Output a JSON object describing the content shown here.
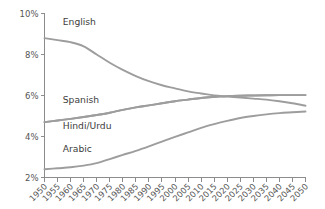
{
  "chart_data": {
    "type": "line",
    "title": "",
    "subtitle": "",
    "xlabel": "",
    "ylabel": "",
    "xlim": [
      1950,
      2050
    ],
    "ylim": [
      2,
      10
    ],
    "yticks": [
      10,
      8,
      6,
      4,
      2
    ],
    "ytick_labels": [
      "10%",
      "8%",
      "6%",
      "4%",
      "2%"
    ],
    "grid": false,
    "legend_position": "inline-labels",
    "x": [
      1950,
      1955,
      1960,
      1965,
      1970,
      1975,
      1980,
      1985,
      1990,
      1995,
      2000,
      2005,
      2010,
      2015,
      2020,
      2025,
      2030,
      2035,
      2040,
      2045,
      2050
    ],
    "series": [
      {
        "name": "English",
        "label": "English",
        "color": "#9d9d9d",
        "label_x": 1957,
        "label_y": 9.45,
        "values": [
          8.8,
          8.7,
          8.6,
          8.4,
          8.0,
          7.6,
          7.25,
          6.95,
          6.7,
          6.5,
          6.35,
          6.2,
          6.1,
          6.0,
          5.95,
          5.9,
          5.85,
          5.8,
          5.72,
          5.62,
          5.5
        ]
      },
      {
        "name": "Spanish",
        "label": "Spanish",
        "color": "#9d9d9d",
        "label_x": 1957,
        "label_y": 5.62,
        "values": [
          4.7,
          4.78,
          4.86,
          4.95,
          5.05,
          5.16,
          5.3,
          5.42,
          5.52,
          5.62,
          5.72,
          5.8,
          5.88,
          5.93,
          5.97,
          5.99,
          6.0,
          6.01,
          6.02,
          6.02,
          6.02
        ]
      },
      {
        "name": "Hindi/Urdu",
        "label": "Hindi/Urdu",
        "color": "#9d9d9d",
        "label_x": 1957,
        "label_y": 4.38,
        "values": [
          4.7,
          4.78,
          4.86,
          4.95,
          5.05,
          5.16,
          5.3,
          5.42,
          5.52,
          5.62,
          5.72,
          5.8,
          5.88,
          5.93,
          5.97,
          5.99,
          6.0,
          6.01,
          6.02,
          6.02,
          6.02
        ]
      },
      {
        "name": "Arabic",
        "label": "Arabic",
        "color": "#9d9d9d",
        "label_x": 1957,
        "label_y": 3.25,
        "values": [
          2.4,
          2.45,
          2.5,
          2.58,
          2.7,
          2.9,
          3.1,
          3.3,
          3.52,
          3.75,
          3.98,
          4.2,
          4.42,
          4.6,
          4.76,
          4.9,
          5.0,
          5.08,
          5.14,
          5.18,
          5.22
        ]
      }
    ]
  },
  "axis": {
    "y_tick_labels": [
      "10%",
      "8%",
      "6%",
      "4%",
      "2%"
    ],
    "x_tick_labels": [
      "1950",
      "1955",
      "1960",
      "1965",
      "1970",
      "1975",
      "1980",
      "1985",
      "1990",
      "1995",
      "2000",
      "2005",
      "2010",
      "2015",
      "2020",
      "2025",
      "2030",
      "2035",
      "2040",
      "2045",
      "2050"
    ],
    "axis_color": "#8c8c8c",
    "label_color": "#555555"
  },
  "style": {
    "background": "#ffffff",
    "line_color": "#9d9d9d"
  }
}
